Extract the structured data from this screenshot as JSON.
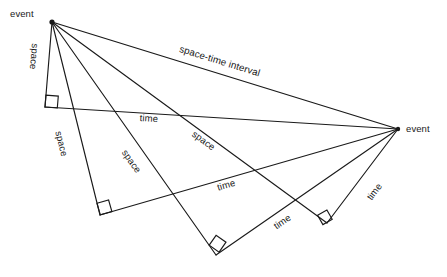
{
  "figure": {
    "background_color": "#ffffff",
    "line_color": "#1a1a1a",
    "events": [
      {
        "id": "event-left",
        "label": "event",
        "x": 52,
        "y": 22
      },
      {
        "id": "event-right",
        "label": "event",
        "x": 398,
        "y": 129
      }
    ],
    "hypotenuse": {
      "label": "space-time interval",
      "from": "event-left",
      "to": "event-right"
    },
    "triangles": [
      {
        "id": "triangle-1",
        "corner": {
          "x": 45,
          "y": 107
        },
        "space_label": "space",
        "time_label": "time",
        "right_angle": true
      },
      {
        "id": "triangle-2",
        "corner": {
          "x": 100,
          "y": 215
        },
        "space_label": "space",
        "time_label": "time",
        "right_angle": true
      },
      {
        "id": "triangle-3",
        "corner": {
          "x": 216,
          "y": 255
        },
        "space_label": "space",
        "time_label": "time",
        "right_angle": true
      },
      {
        "id": "triangle-4",
        "corner": {
          "x": 327,
          "y": 223
        },
        "space_label": "space",
        "time_label": "time",
        "right_angle": true
      }
    ],
    "labels": {
      "event_left": "event",
      "event_right": "event",
      "interval": "space-time interval",
      "space_1": "space",
      "space_2": "space",
      "space_3": "space",
      "space_4": "space",
      "time_1": "time",
      "time_2": "time",
      "time_3": "time",
      "time_4": "time"
    }
  }
}
